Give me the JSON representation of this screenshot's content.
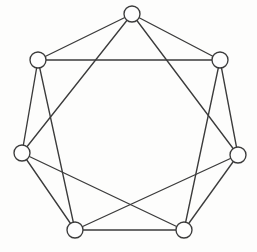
{
  "figure": {
    "kind": "undirected-graph-diagram",
    "background_color": "#fdfdfc",
    "line_color": "#3b3b3b",
    "vertex_fill_color": "#fefefe",
    "line_width": 1.35,
    "vertex_radius": 8,
    "vertex_count": 7,
    "edge_count": 14,
    "vertex_degree": 4,
    "labels_visible": false
  },
  "chart_data": {
    "type": "scatter",
    "xlabel": "",
    "ylabel": "",
    "grid": false,
    "legend": "none",
    "xlim": [
      0,
      257
    ],
    "ylim": [
      0,
      252
    ],
    "layout": "regular-heptagon",
    "center": [
      130,
      128
    ],
    "radius": 115,
    "nodes": [
      {
        "id": "v0",
        "label": "",
        "x": 132,
        "y": 14,
        "degree": 4
      },
      {
        "id": "v1",
        "label": "",
        "x": 220,
        "y": 60,
        "degree": 4
      },
      {
        "id": "v2",
        "label": "",
        "x": 238,
        "y": 155,
        "degree": 4
      },
      {
        "id": "v3",
        "label": "",
        "x": 184,
        "y": 230,
        "degree": 4
      },
      {
        "id": "v4",
        "label": "",
        "x": 75,
        "y": 230,
        "degree": 4
      },
      {
        "id": "v5",
        "label": "",
        "x": 22,
        "y": 153,
        "degree": 4
      },
      {
        "id": "v6",
        "label": "",
        "x": 38,
        "y": 60,
        "degree": 4
      }
    ],
    "edges": [
      {
        "source": "v0",
        "target": "v1",
        "step": 1
      },
      {
        "source": "v1",
        "target": "v2",
        "step": 1
      },
      {
        "source": "v2",
        "target": "v3",
        "step": 1
      },
      {
        "source": "v3",
        "target": "v4",
        "step": 1
      },
      {
        "source": "v4",
        "target": "v5",
        "step": 1
      },
      {
        "source": "v5",
        "target": "v6",
        "step": 1
      },
      {
        "source": "v6",
        "target": "v0",
        "step": 1
      },
      {
        "source": "v0",
        "target": "v2",
        "step": 2
      },
      {
        "source": "v1",
        "target": "v3",
        "step": 2
      },
      {
        "source": "v2",
        "target": "v4",
        "step": 2
      },
      {
        "source": "v3",
        "target": "v5",
        "step": 2
      },
      {
        "source": "v4",
        "target": "v6",
        "step": 2
      },
      {
        "source": "v5",
        "target": "v0",
        "step": 2
      },
      {
        "source": "v6",
        "target": "v1",
        "step": 2
      }
    ]
  }
}
